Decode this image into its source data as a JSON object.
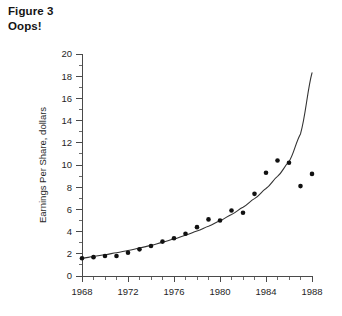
{
  "caption": {
    "line1": "Figure 3",
    "line2": "Oops!"
  },
  "chart_data": {
    "type": "scatter",
    "title": "Figure 3 Oops!",
    "xlabel": "",
    "ylabel": "Earnings Per Share, dollars",
    "xlim": [
      1968,
      1988
    ],
    "ylim": [
      0,
      20
    ],
    "grid": false,
    "legend": false,
    "x_major_ticks": [
      1968,
      1972,
      1976,
      1980,
      1984,
      1988
    ],
    "x_minor_ticks": [
      1969,
      1970,
      1971,
      1973,
      1974,
      1975,
      1977,
      1978,
      1979,
      1981,
      1982,
      1983,
      1985,
      1986,
      1987
    ],
    "y_major_ticks": [
      0,
      2,
      4,
      6,
      8,
      10,
      12,
      14,
      16,
      18,
      20
    ],
    "series": [
      {
        "name": "Earnings Per Share",
        "type": "scatter",
        "marker": "circle",
        "color": "#111111",
        "x": [
          1968,
          1969,
          1970,
          1971,
          1972,
          1973,
          1974,
          1975,
          1976,
          1977,
          1978,
          1979,
          1980,
          1981,
          1982,
          1983,
          1984,
          1985,
          1986,
          1987,
          1988
        ],
        "values": [
          1.6,
          1.7,
          1.8,
          1.8,
          2.1,
          2.4,
          2.7,
          3.1,
          3.4,
          3.8,
          4.4,
          5.1,
          5.0,
          5.9,
          5.7,
          7.4,
          9.3,
          10.4,
          10.2,
          8.1,
          9.2
        ]
      },
      {
        "name": "Exponential trend fit",
        "type": "line",
        "color": "#333333",
        "x": [
          1968,
          1969,
          1970,
          1971,
          1972,
          1973,
          1974,
          1975,
          1976,
          1977,
          1978,
          1979,
          1980,
          1981,
          1982,
          1983,
          1984,
          1985,
          1986,
          1987,
          1988
        ],
        "values": [
          1.6,
          1.75,
          1.92,
          2.1,
          2.3,
          2.52,
          2.76,
          3.03,
          3.33,
          3.67,
          4.05,
          4.48,
          4.98,
          5.55,
          6.2,
          6.97,
          7.88,
          8.97,
          10.3,
          12.8,
          18.3
        ]
      }
    ]
  }
}
